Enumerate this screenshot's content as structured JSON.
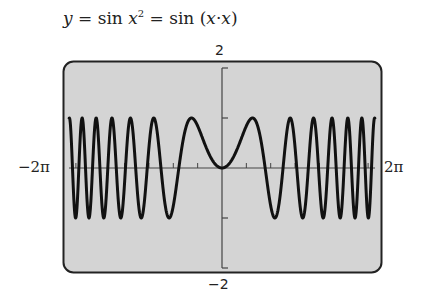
{
  "title": {
    "y": "y",
    "eq1": " = sin ",
    "x": "x",
    "exp": "2",
    "eq2": " = sin (",
    "x2": "x",
    "dot": "·",
    "x3": "x",
    "close": ")"
  },
  "labels": {
    "ymax": "2",
    "ymin": "−2",
    "xmin": "−2π",
    "xmax": "2π"
  },
  "colors": {
    "screen_bg": "#d4d4d4",
    "frame": "#222222",
    "curve": "#111111",
    "axis": "#444444"
  },
  "chart_data": {
    "type": "line",
    "function": "sin(x*x)",
    "xlabel": "",
    "ylabel": "",
    "xlim": [
      -6.2832,
      6.2832
    ],
    "ylim": [
      -2,
      2
    ],
    "x_tick_labels": [
      "−2π",
      "2π"
    ],
    "y_tick_labels": [
      "−2",
      "2"
    ],
    "y_ticks": [
      -2,
      -1,
      0,
      1,
      2
    ],
    "x_ticks": [
      -6,
      -5,
      -4,
      -3,
      -2,
      -1,
      0,
      1,
      2,
      3,
      4,
      5,
      6
    ],
    "grid": false,
    "legend": false,
    "samples": {
      "x": [
        -6.28,
        -5,
        -4,
        -3,
        -2,
        -1.772,
        -1,
        0,
        1,
        1.772,
        2,
        3,
        4,
        5,
        6.28
      ],
      "y": [
        -0.98,
        -0.13,
        -0.29,
        0.41,
        -0.76,
        0.0,
        0.84,
        0,
        0.84,
        0.0,
        -0.76,
        0.41,
        -0.29,
        -0.13,
        -0.98
      ]
    }
  }
}
